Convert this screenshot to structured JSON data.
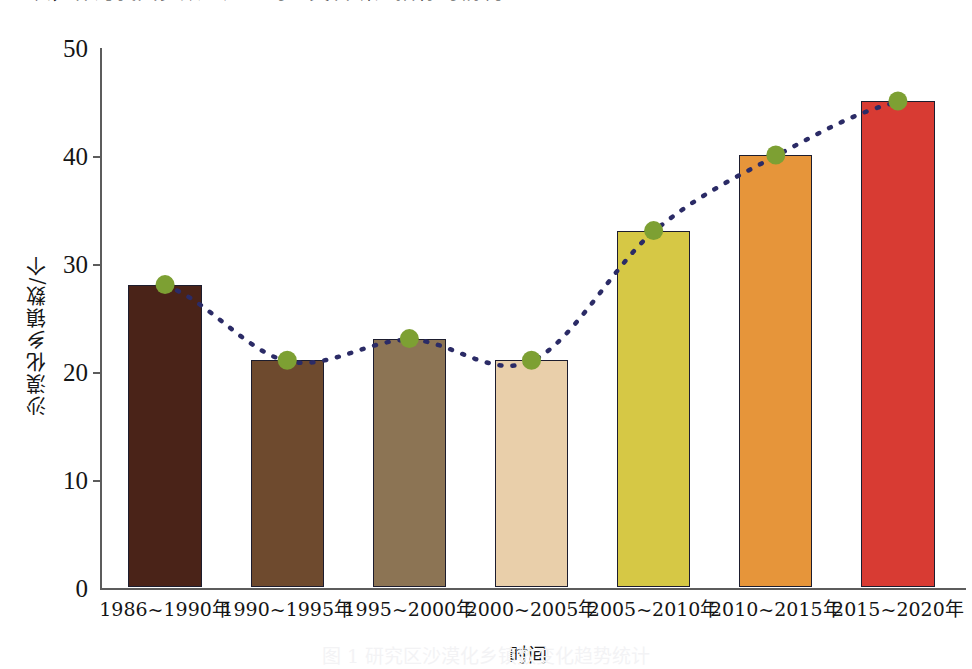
{
  "page": {
    "top_clipped_text": "一次，作为我国多数地产生的二类科研究指标的情况。",
    "bottom_caption_faint": "图 1 研究区沙漠化乡镇数变化趋势统计"
  },
  "chart_data": {
    "type": "bar",
    "title": "",
    "xlabel": "时间",
    "ylabel": "沙漠化乡镇数/个",
    "categories": [
      "1986~1990年",
      "1990~1995年",
      "1995~2000年",
      "2000~2005年",
      "2005~2010年",
      "2010~2015年",
      "2015~2020年"
    ],
    "values": [
      28,
      21,
      23,
      21,
      33,
      40,
      45
    ],
    "bar_colors": [
      "#4A2318",
      "#6E4A2E",
      "#8C7454",
      "#E9CFAA",
      "#D6C845",
      "#E6953A",
      "#D83B33"
    ],
    "ylim": [
      0,
      50
    ],
    "y_ticks": [
      "0",
      "10",
      "20",
      "30",
      "40",
      "50"
    ],
    "y_tick_values": [
      0,
      10,
      20,
      30,
      40,
      50
    ],
    "grid": false,
    "legend": "none",
    "series": [
      {
        "name": "沙漠化乡镇数",
        "values": [
          28,
          21,
          23,
          21,
          33,
          40,
          45
        ],
        "marker_color": "#7DA033",
        "trend_line_color": "#2B2B66",
        "trend_line_style": "dotted"
      }
    ]
  }
}
